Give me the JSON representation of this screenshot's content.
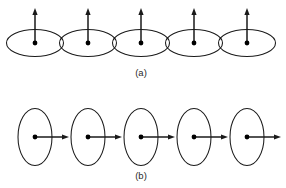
{
  "figure": {
    "background_color": "#ffffff",
    "stroke_color": "#1a1a1a",
    "dot_color": "#000000",
    "label_color": "#2a2a2a",
    "width": 286,
    "height": 188
  },
  "panels": [
    {
      "id": "a",
      "label": "(a)",
      "label_x": 141,
      "label_y": 73,
      "loop_orientation": "horizontal",
      "vector_direction": "up",
      "loop_count": 5,
      "loop_rx": 28.5,
      "loop_ry": 13.5,
      "loop_cy": 43,
      "vector_length": 35,
      "loops": [
        {
          "cx": 35,
          "cy": 43,
          "vector_x": 35,
          "vector_y1": 43,
          "vector_y2": 8
        },
        {
          "cx": 88,
          "cy": 43,
          "vector_x": 88,
          "vector_y1": 43,
          "vector_y2": 8
        },
        {
          "cx": 141,
          "cy": 43,
          "vector_x": 141,
          "vector_y1": 43,
          "vector_y2": 8
        },
        {
          "cx": 194,
          "cy": 43,
          "vector_x": 194,
          "vector_y1": 43,
          "vector_y2": 8
        },
        {
          "cx": 247,
          "cy": 43,
          "vector_x": 247,
          "vector_y1": 43,
          "vector_y2": 8
        }
      ]
    },
    {
      "id": "b",
      "label": "(b)",
      "label_x": 141,
      "label_y": 176,
      "loop_orientation": "vertical",
      "vector_direction": "right",
      "loop_count": 5,
      "loop_rx": 17,
      "loop_ry": 28.5,
      "loop_cy": 137,
      "vector_length": 34,
      "loops": [
        {
          "cx": 35,
          "cy": 137,
          "vector_y": 137,
          "vector_x1": 35,
          "vector_x2": 69
        },
        {
          "cx": 88,
          "cy": 137,
          "vector_y": 137,
          "vector_x1": 88,
          "vector_x2": 122
        },
        {
          "cx": 141,
          "cy": 137,
          "vector_y": 137,
          "vector_x1": 141,
          "vector_x2": 175
        },
        {
          "cx": 194,
          "cy": 137,
          "vector_y": 137,
          "vector_x1": 194,
          "vector_x2": 228
        },
        {
          "cx": 247,
          "cy": 137,
          "vector_y": 137,
          "vector_x1": 247,
          "vector_x2": 281
        }
      ]
    }
  ],
  "geometry": {
    "dot_radius": 2.4,
    "arrow_head_length": 7,
    "arrow_head_half_width": 2.6
  }
}
